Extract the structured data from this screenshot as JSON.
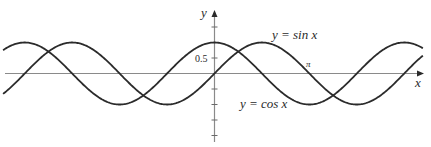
{
  "chart_data": {
    "type": "line",
    "title": "",
    "xlabel": "x",
    "ylabel": "y",
    "xlim": [
      -7.0,
      6.9
    ],
    "ylim": [
      -2.2,
      2.2
    ],
    "grid": false,
    "legend": "none (inline curve labels)",
    "x_ticks": [
      {
        "value": 3.14159,
        "label": "π"
      }
    ],
    "y_ticks": [
      {
        "value": 1.5,
        "label": ""
      },
      {
        "value": 1.0,
        "label": ""
      },
      {
        "value": 0.5,
        "label": "0.5"
      },
      {
        "value": -0.5,
        "label": ""
      },
      {
        "value": -1.0,
        "label": ""
      },
      {
        "value": -1.5,
        "label": ""
      },
      {
        "value": -2.0,
        "label": ""
      }
    ],
    "series": [
      {
        "name": "y = sin x",
        "function": "sin",
        "x_range": [
          -7.0,
          6.9
        ],
        "key_points": [
          [
            -6.283,
            0
          ],
          [
            -4.712,
            1
          ],
          [
            -3.1416,
            0
          ],
          [
            -1.5708,
            -1
          ],
          [
            0,
            0
          ],
          [
            1.5708,
            1
          ],
          [
            3.1416,
            0
          ],
          [
            4.712,
            -1
          ],
          [
            6.283,
            0
          ]
        ]
      },
      {
        "name": "y = cos x",
        "function": "cos",
        "x_range": [
          -7.0,
          6.9
        ],
        "key_points": [
          [
            -6.283,
            1
          ],
          [
            -4.712,
            0
          ],
          [
            -3.1416,
            -1
          ],
          [
            -1.5708,
            0
          ],
          [
            0,
            1
          ],
          [
            1.5708,
            0
          ],
          [
            3.1416,
            -1
          ],
          [
            4.712,
            0
          ],
          [
            6.283,
            1
          ]
        ]
      }
    ],
    "annotations": [
      {
        "text": "y = sin x",
        "near_x": 2.4,
        "near_y": 1.35
      },
      {
        "text": "y = cos x",
        "near_x": 1.2,
        "near_y": -1.1
      },
      {
        "text": "π",
        "near_x": 3.14,
        "near_y": 0.25
      }
    ]
  },
  "labels": {
    "y_axis": "y",
    "x_axis": "x",
    "tick_half": "0.5",
    "pi": "π",
    "sin_label": "y = sin x",
    "cos_label": "y = cos x"
  },
  "colors": {
    "curve": "#2b2b2b",
    "axis": "#8a8a8a",
    "text": "#2a2a2a"
  }
}
